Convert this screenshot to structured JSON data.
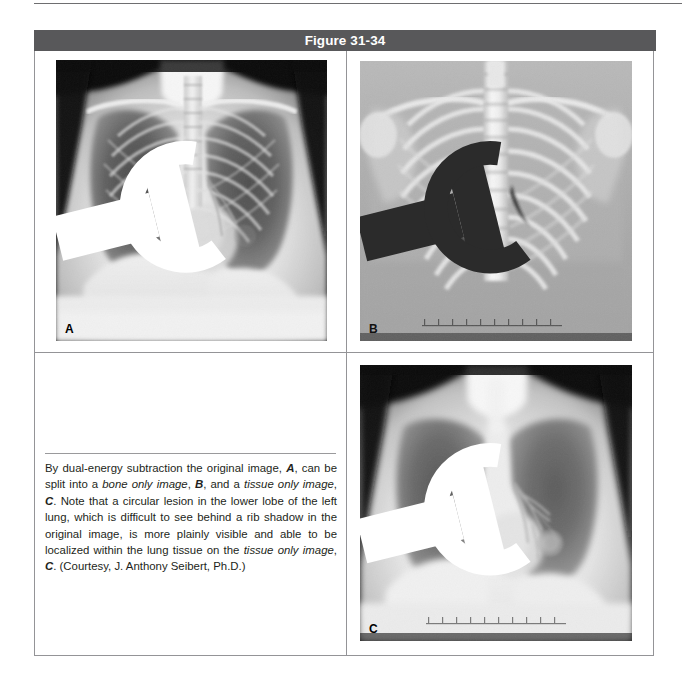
{
  "page": {
    "figure_number": "Figure 31-34",
    "background": "#ffffff",
    "header_bar_color": "#58585a",
    "border_color": "#949497",
    "text_color": "#231f20"
  },
  "figure": {
    "title": "Figure 31-34",
    "panels": [
      {
        "id": "a",
        "label": "A",
        "description": "original chest radiograph",
        "side_marker": "R",
        "position": "top-left"
      },
      {
        "id": "b",
        "label": "B",
        "description": "bone only image",
        "side_marker": "R",
        "position": "top-right"
      },
      {
        "id": "c",
        "label": "C",
        "description": "tissue only image",
        "side_marker": "R",
        "position": "bottom-right"
      }
    ],
    "caption": {
      "segments": [
        {
          "text": "By dual-energy subtraction the original image, ",
          "style": "normal"
        },
        {
          "text": "A",
          "style": "bold-italic"
        },
        {
          "text": ", can be split into a ",
          "style": "normal"
        },
        {
          "text": "bone only image",
          "style": "italic"
        },
        {
          "text": ", ",
          "style": "normal"
        },
        {
          "text": "B",
          "style": "bold-italic"
        },
        {
          "text": ", and a ",
          "style": "normal"
        },
        {
          "text": "tissue only image",
          "style": "italic"
        },
        {
          "text": ", ",
          "style": "normal"
        },
        {
          "text": "C",
          "style": "bold-italic"
        },
        {
          "text": ". Note that a circular lesion in the lower lobe of the left lung, which is difficult to see behind a rib shadow in the original image, is more plainly visible and able to be localized within the lung tissue on the ",
          "style": "normal"
        },
        {
          "text": "tissue only image",
          "style": "italic"
        },
        {
          "text": ", ",
          "style": "normal"
        },
        {
          "text": "C",
          "style": "bold-italic"
        },
        {
          "text": ". (Courtesy, J. Anthony Seibert, Ph.D.)",
          "style": "normal"
        }
      ],
      "plain_text": "By dual-energy subtraction the original image, A, can be split into a bone only image, B, and a tissue only image, C. Note that a circular lesion in the lower lobe of the left lung, which is difficult to see behind a rib shadow in the original image, is more plainly visible and able to be localized within the lung tissue on the tissue only image, C. (Courtesy, J. Anthony Seibert, Ph.D.)"
    }
  }
}
